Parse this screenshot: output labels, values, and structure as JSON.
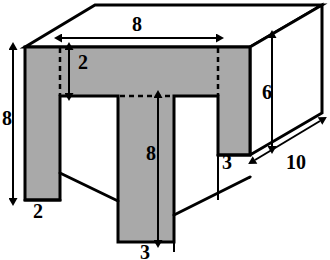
{
  "figure": {
    "colors": {
      "face_fill": "#a9a9a9",
      "top_fill": "#ffffff",
      "side_fill": "#ffffff",
      "outline": "#000000",
      "background": "#ffffff"
    },
    "style": {
      "outline_width": 3,
      "dimension_line_width": 2,
      "hidden_line_dash": "5,4"
    }
  },
  "dimensions": [
    {
      "id": "top-width",
      "value": "8",
      "x": 137,
      "y": 24,
      "orientation": "horizontal",
      "description": "overall front face width"
    },
    {
      "id": "notch-depth",
      "value": "2",
      "x": 82,
      "y": 58,
      "orientation": "vertical",
      "description": "depth from top to notch ceiling"
    },
    {
      "id": "left-height",
      "value": "8",
      "x": 6,
      "y": 115,
      "orientation": "vertical",
      "description": "overall front face height"
    },
    {
      "id": "left-leg-width",
      "value": "2",
      "x": 33,
      "y": 205,
      "orientation": "horizontal",
      "description": "left leg thickness"
    },
    {
      "id": "center-height",
      "value": "8",
      "x": 151,
      "y": 150,
      "orientation": "vertical",
      "description": "center leg height"
    },
    {
      "id": "center-width",
      "value": "3",
      "x": 160,
      "y": 243,
      "orientation": "horizontal",
      "description": "center leg width"
    },
    {
      "id": "right-height",
      "value": "6",
      "x": 264,
      "y": 90,
      "orientation": "vertical",
      "description": "right leg height"
    },
    {
      "id": "right-width",
      "value": "3",
      "x": 223,
      "y": 155,
      "orientation": "horizontal",
      "description": "right leg width"
    },
    {
      "id": "depth",
      "value": "10",
      "x": 293,
      "y": 150,
      "orientation": "oblique",
      "description": "block depth into the page"
    }
  ],
  "geometry": {
    "front_face_outline": "M 25,47 L 250,47 L 250,155 L 218,155 L 218,96 L 174,96 L 174,242 L 118,242 L 118,96 L 60,96 L 60,200 L 25,200 Z",
    "top_face_outline": "M 25,47 L 95,5 L 322,5 L 250,47 Z",
    "right_face_outline": "M 250,47 L 322,5 L 322,113 L 250,155 Z",
    "left_notch_back_floor": "M 60,173 L 118,201",
    "center_right_back_floor": "M 174,215 L 250,177",
    "right_leg_back_floor": "M 218,155 L 250,155",
    "hidden_edges": [
      "M 60,47 L 60,96",
      "M 218,47 L 218,96",
      "M 118,96 L 174,96"
    ]
  }
}
